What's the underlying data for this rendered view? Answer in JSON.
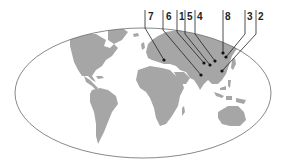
{
  "map": {
    "title": "",
    "projection": "elliptical world map",
    "colors": {
      "land": "#a6a6a6",
      "ocean": "#ffffff",
      "outline": "#6a6a6a",
      "leader": "#222222",
      "label": "#222222"
    },
    "markers": [
      {
        "id": "7",
        "label": "7",
        "label_x": 148,
        "line_x": 145,
        "dot": [
          164,
          60
        ]
      },
      {
        "id": "6",
        "label": "6",
        "label_x": 166,
        "line_x": 163,
        "dot": [
          201,
          75
        ]
      },
      {
        "id": "1",
        "label": "1",
        "label_x": 179,
        "line_x": 177,
        "dot": [
          204,
          63
        ]
      },
      {
        "id": "5",
        "label": "5",
        "label_x": 187,
        "line_x": 185,
        "dot": [
          210,
          65
        ]
      },
      {
        "id": "4",
        "label": "4",
        "label_x": 197,
        "line_x": 195,
        "dot": [
          215,
          61
        ]
      },
      {
        "id": "8",
        "label": "8",
        "label_x": 225,
        "line_x": 223,
        "dot": [
          223,
          53
        ]
      },
      {
        "id": "3",
        "label": "3",
        "label_x": 247,
        "line_x": 245,
        "dot": [
          226,
          57
        ]
      },
      {
        "id": "2",
        "label": "2",
        "label_x": 258,
        "line_x": 256,
        "dot": [
          222,
          71
        ]
      }
    ]
  }
}
